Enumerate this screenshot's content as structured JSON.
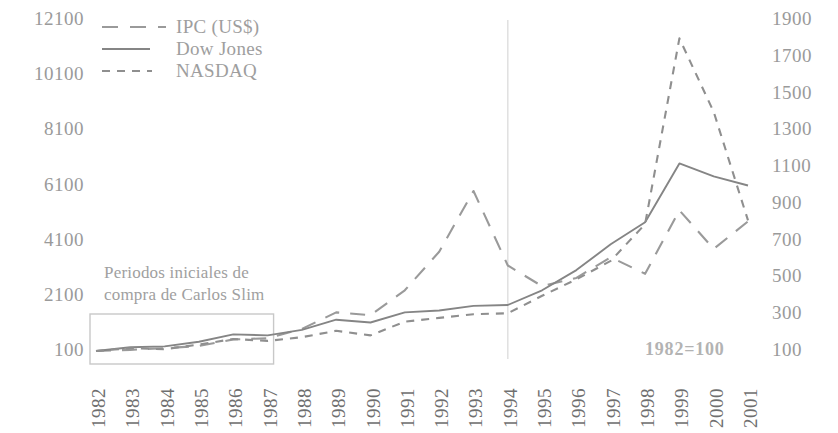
{
  "chart_data": {
    "type": "line",
    "title": "",
    "subtitle": "",
    "xlabel": "",
    "ylabel": "",
    "grid": false,
    "legend_position": "top-left",
    "x": [
      1982,
      1983,
      1984,
      1985,
      1986,
      1987,
      1988,
      1989,
      1990,
      1991,
      1992,
      1993,
      1994,
      1995,
      1996,
      1997,
      1998,
      1999,
      2000,
      2001
    ],
    "categories": [
      "1982",
      "1983",
      "1984",
      "1985",
      "1986",
      "1987",
      "1988",
      "1989",
      "1990",
      "1991",
      "1992",
      "1993",
      "1994",
      "1995",
      "1996",
      "1997",
      "1998",
      "1999",
      "2000",
      "2001"
    ],
    "axes": {
      "left": {
        "ticks": [
          100,
          2100,
          4100,
          6100,
          8100,
          10100,
          12100
        ],
        "ylim": [
          100,
          12100
        ],
        "assigned_series": [
          "IPC (US$)"
        ]
      },
      "right": {
        "ticks": [
          100,
          300,
          500,
          700,
          900,
          1100,
          1300,
          1500,
          1700,
          1900
        ],
        "ylim": [
          100,
          1900
        ],
        "assigned_series": [
          "Dow Jones",
          "NASDAQ"
        ]
      }
    },
    "series": [
      {
        "name": "IPC (US$)",
        "axis": "left",
        "style": "long-dash",
        "values": [
          100,
          140,
          200,
          280,
          520,
          560,
          900,
          1500,
          1400,
          2300,
          3700,
          5900,
          3200,
          2450,
          2750,
          3500,
          2900,
          5200,
          3800,
          4800
        ]
      },
      {
        "name": "Dow Jones",
        "axis": "right",
        "style": "solid",
        "values": [
          100,
          120,
          125,
          150,
          190,
          185,
          215,
          270,
          255,
          310,
          320,
          345,
          350,
          430,
          540,
          680,
          800,
          1120,
          1050,
          1000
        ]
      },
      {
        "name": "NASDAQ",
        "axis": "right",
        "style": "short-dash",
        "values": [
          100,
          115,
          110,
          135,
          165,
          155,
          175,
          210,
          185,
          260,
          280,
          300,
          305,
          400,
          490,
          590,
          790,
          1800,
          1400,
          810
        ]
      }
    ],
    "annotations": [
      {
        "name": "carlos-slim-note",
        "text": "Periodos iniciales de\ncompra de Carlos Slim"
      },
      {
        "name": "base-year-note",
        "text": "1982=100"
      }
    ],
    "highlight_box": {
      "name": "carlos-slim-period-box",
      "x_start": "1982",
      "x_end": "1987"
    },
    "vertical_marker": {
      "name": "year-1994-marker",
      "x": "1994"
    },
    "colors": {
      "ipc": "#9a9a9a",
      "dow_jones": "#858585",
      "nasdaq": "#8f8f8f",
      "axis_text": "#9a9a9a",
      "xtick_text": "#6f6f6f",
      "annotation": "#a0a0a0",
      "base_note": "#b3b3b3",
      "box_stroke": "#c8c8c8",
      "background": "#ffffff"
    }
  },
  "legend": {
    "items": [
      {
        "label": "IPC (US$)",
        "key": "long-dash-key"
      },
      {
        "label": "Dow Jones",
        "key": "solid-line-key"
      },
      {
        "label": "NASDAQ",
        "key": "short-dash-key"
      }
    ]
  },
  "axis_left": {
    "ticks": [
      "12100",
      "10100",
      "8100",
      "6100",
      "4100",
      "2100",
      "100"
    ]
  },
  "axis_right": {
    "ticks": [
      "1900",
      "1700",
      "1500",
      "1300",
      "1100",
      "900",
      "700",
      "500",
      "300",
      "100"
    ]
  },
  "axis_x": {
    "ticks": [
      "1982",
      "1983",
      "1984",
      "1985",
      "1986",
      "1987",
      "1988",
      "1989",
      "1990",
      "1991",
      "1992",
      "1993",
      "1994",
      "1995",
      "1996",
      "1997",
      "1998",
      "1999",
      "2000",
      "2001"
    ]
  },
  "annotations": {
    "carlos_slim": "Periodos iniciales de\ncompra de Carlos Slim",
    "base_year": "1982=100"
  }
}
